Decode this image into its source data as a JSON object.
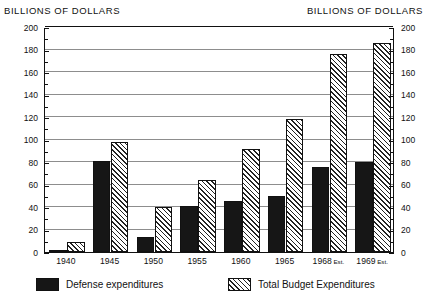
{
  "titles": {
    "left": "BILLIONS OF DOLLARS",
    "right": "BILLIONS OF DOLLARS"
  },
  "legend": [
    {
      "key": "defense",
      "label": "Defense expenditures",
      "color": "#161616",
      "fill": "solid"
    },
    {
      "key": "total",
      "label": "Total Budget Expenditures",
      "color": "#d8d8d8",
      "fill": "diagonal-hatch"
    }
  ],
  "chart_data": {
    "type": "bar",
    "title": "BILLIONS OF DOLLARS",
    "xlabel": "",
    "ylabel": "BILLIONS OF DOLLARS",
    "ylim": [
      0,
      200
    ],
    "ytick_step": 20,
    "yminor_step": 10,
    "grid": true,
    "legend_position": "bottom",
    "categories": [
      "1940",
      "1945",
      "1950",
      "1955",
      "1960",
      "1965",
      "1968 Est.",
      "1969 Est."
    ],
    "category_labels": [
      {
        "year": "1940",
        "suffix": ""
      },
      {
        "year": "1945",
        "suffix": ""
      },
      {
        "year": "1950",
        "suffix": ""
      },
      {
        "year": "1955",
        "suffix": ""
      },
      {
        "year": "1960",
        "suffix": ""
      },
      {
        "year": "1965",
        "suffix": ""
      },
      {
        "year": "1968",
        "suffix": "Est."
      },
      {
        "year": "1969",
        "suffix": "Est."
      }
    ],
    "yticks": [
      0,
      20,
      40,
      60,
      80,
      100,
      120,
      140,
      160,
      180,
      200
    ],
    "series": [
      {
        "name": "Defense expenditures",
        "values": [
          2,
          81,
          13,
          41,
          45,
          50,
          76,
          80
        ]
      },
      {
        "name": "Total Budget Expenditures",
        "values": [
          9,
          98,
          40,
          64,
          92,
          118,
          176,
          186
        ]
      }
    ]
  }
}
